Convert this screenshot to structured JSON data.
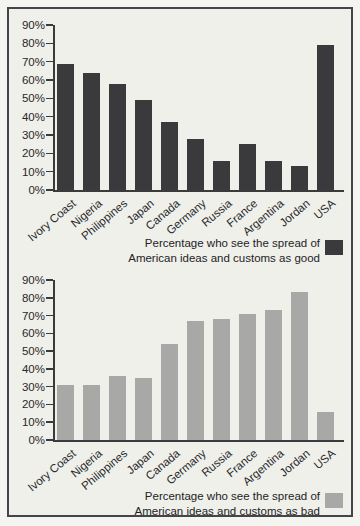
{
  "figure": {
    "border_color": "#43454a",
    "paper_background": "#eff0ea",
    "axis_color": "#3a3b3d",
    "text_color": "#28282a"
  },
  "chart_data": [
    {
      "type": "bar",
      "title": "",
      "legend_line1": "Percentage who see the spread of",
      "legend_line2": "American ideas and customs as good",
      "bar_color": "#3a3a3d",
      "categories": [
        "Ivory Coast",
        "Nigeria",
        "Philippines",
        "Japan",
        "Canada",
        "Germany",
        "Russia",
        "France",
        "Argentina",
        "Jordan",
        "USA"
      ],
      "values": [
        69,
        64,
        58,
        49,
        37,
        28,
        16,
        25,
        16,
        13,
        79
      ],
      "xlabel": "",
      "ylabel": "",
      "ylim": [
        0,
        90
      ],
      "ytick_step": 10,
      "yticks": [
        "0%",
        "10%",
        "20%",
        "30%",
        "40%",
        "50%",
        "60%",
        "70%",
        "80%",
        "90%"
      ],
      "grid": false,
      "legend_position": "bottom-right"
    },
    {
      "type": "bar",
      "title": "",
      "legend_line1": "Percentage who see the spread of",
      "legend_line2": "American ideas and customs as bad",
      "bar_color": "#a8a9a6",
      "categories": [
        "Ivory Coast",
        "Nigeria",
        "Philippines",
        "Japan",
        "Canada",
        "Germany",
        "Russia",
        "France",
        "Argentina",
        "Jordan",
        "USA"
      ],
      "values": [
        31,
        31,
        36,
        35,
        54,
        67,
        68,
        71,
        73,
        83,
        16
      ],
      "xlabel": "",
      "ylabel": "",
      "ylim": [
        0,
        90
      ],
      "ytick_step": 10,
      "yticks": [
        "0%",
        "10%",
        "20%",
        "30%",
        "40%",
        "50%",
        "60%",
        "70%",
        "80%",
        "90%"
      ],
      "grid": false,
      "legend_position": "bottom-right"
    }
  ]
}
